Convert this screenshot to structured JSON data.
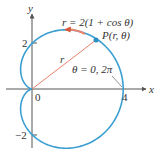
{
  "diagram": {
    "equation": "r = 2(1 + cos θ)",
    "point_label": "P(r, θ)",
    "radius_label": "r",
    "angle_label": "θ = 0, 2π",
    "axes": {
      "x_label": "x",
      "y_label": "y",
      "origin_label": "0",
      "x_tick_label": "4",
      "y_tick_top_label": "2",
      "y_tick_bottom_label": "−2"
    },
    "colors": {
      "curve": "#3a9fd0",
      "radius": "#e8826a",
      "arrow": "#d9573a",
      "point": "#2a8fc0",
      "axes": "#555555"
    }
  }
}
